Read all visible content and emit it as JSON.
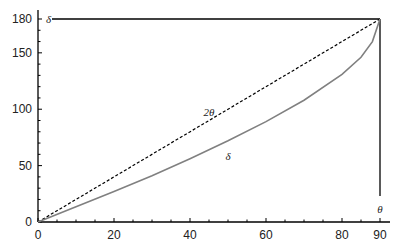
{
  "chart_data": {
    "type": "line",
    "title": "",
    "xlabel": "θ",
    "ylabel": "δ",
    "xlim": [
      0,
      90
    ],
    "ylim": [
      0,
      180
    ],
    "xticks": [
      0,
      20,
      40,
      60,
      80,
      90
    ],
    "yticks": [
      0,
      50,
      100,
      150,
      180
    ],
    "grid": false,
    "legend": "inline labels",
    "series": [
      {
        "name": "2θ",
        "style": "dashed",
        "color": "#000000",
        "x": [
          0,
          90
        ],
        "y": [
          0,
          180
        ]
      },
      {
        "name": "δ",
        "style": "solid",
        "color": "#808080",
        "x": [
          0,
          10,
          20,
          30,
          40,
          50,
          60,
          70,
          80,
          85,
          88,
          90
        ],
        "y": [
          0,
          13.5,
          27,
          41,
          56,
          72,
          89,
          108,
          131,
          146,
          160,
          180
        ]
      }
    ],
    "annotations": [
      {
        "text": "2θ",
        "x": 45,
        "y": 94
      },
      {
        "text": "δ",
        "x": 50,
        "y": 55
      }
    ]
  }
}
